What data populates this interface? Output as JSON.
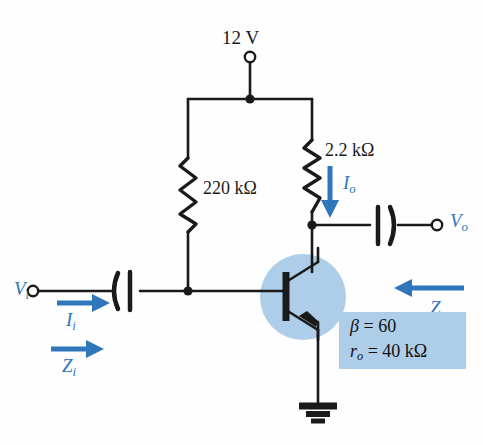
{
  "figure": {
    "type": "circuit-diagram",
    "background_color": "#fefefe",
    "wire_color": "#1a1a1a",
    "accent_color": "#2f76bb",
    "highlight_color": "#aecde8"
  },
  "labels": {
    "supply_voltage": "12 V",
    "base_resistor": "220 kΩ",
    "collector_resistor": "2.2  kΩ",
    "output_current": "I",
    "output_current_sub": "o",
    "input_voltage": "V",
    "input_voltage_sub": "i",
    "input_current": "I",
    "input_current_sub": "i",
    "input_impedance": "Z",
    "input_impedance_sub": "i",
    "output_voltage": "V",
    "output_voltage_sub": "o",
    "output_impedance": "Z",
    "output_impedance_sub": "o"
  },
  "parameters": {
    "beta_label": "β",
    "beta_equals": " = ",
    "beta_value": "60",
    "ro_label": "r",
    "ro_sub": "o",
    "ro_equals": " = ",
    "ro_value": "40 kΩ"
  },
  "components": [
    {
      "name": "supply-terminal",
      "kind": "open-terminal",
      "label": "12 V"
    },
    {
      "name": "base-bias-resistor",
      "kind": "resistor",
      "value": "220 kΩ"
    },
    {
      "name": "collector-resistor",
      "kind": "resistor",
      "value": "2.2  kΩ"
    },
    {
      "name": "input-coupling-capacitor",
      "kind": "capacitor"
    },
    {
      "name": "output-coupling-capacitor",
      "kind": "capacitor"
    },
    {
      "name": "npn-transistor",
      "kind": "bjt-npn"
    },
    {
      "name": "ground-symbol",
      "kind": "ground"
    }
  ]
}
